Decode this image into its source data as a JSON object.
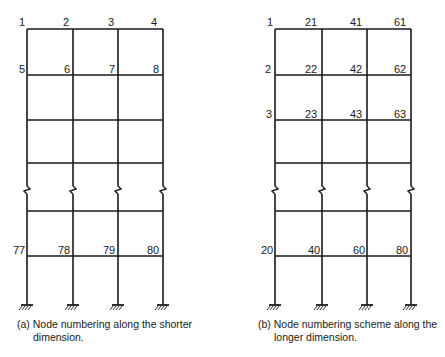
{
  "diagram": {
    "type": "plane frame node numbering",
    "frame_a": {
      "caption_line1": "(a) Node numbering along the shorter",
      "caption_line2": "dimension.",
      "columns_x": [
        27,
        73,
        118,
        163
      ],
      "levels_y": [
        29,
        75,
        120,
        163,
        211,
        256
      ],
      "base_y": 305,
      "break_y": 190,
      "labels": [
        {
          "text": "1",
          "x": 19,
          "y": 17
        },
        {
          "text": "2",
          "x": 63,
          "y": 17
        },
        {
          "text": "3",
          "x": 108,
          "y": 17
        },
        {
          "text": "4",
          "x": 151,
          "y": 17
        },
        {
          "text": "5",
          "x": 19,
          "y": 64
        },
        {
          "text": "6",
          "x": 64,
          "y": 64
        },
        {
          "text": "7",
          "x": 109,
          "y": 64
        },
        {
          "text": "8",
          "x": 153,
          "y": 64
        },
        {
          "text": "77",
          "x": 13,
          "y": 245
        },
        {
          "text": "78",
          "x": 58,
          "y": 245
        },
        {
          "text": "79",
          "x": 103,
          "y": 245
        },
        {
          "text": "80",
          "x": 147,
          "y": 245
        }
      ]
    },
    "frame_b": {
      "caption_line1": "(b) Node numbering scheme along the",
      "caption_line2": "longer dimension.",
      "columns_x": [
        275,
        322,
        367,
        411
      ],
      "levels_y": [
        29,
        75,
        120,
        163,
        211,
        256
      ],
      "base_y": 305,
      "break_y": 190,
      "labels": [
        {
          "text": "1",
          "x": 267,
          "y": 17
        },
        {
          "text": "21",
          "x": 305,
          "y": 17
        },
        {
          "text": "41",
          "x": 350,
          "y": 17
        },
        {
          "text": "61",
          "x": 394,
          "y": 17
        },
        {
          "text": "2",
          "x": 265,
          "y": 64
        },
        {
          "text": "22",
          "x": 305,
          "y": 64
        },
        {
          "text": "42",
          "x": 350,
          "y": 64
        },
        {
          "text": "62",
          "x": 394,
          "y": 64
        },
        {
          "text": "3",
          "x": 266,
          "y": 109
        },
        {
          "text": "23",
          "x": 305,
          "y": 109
        },
        {
          "text": "43",
          "x": 350,
          "y": 109
        },
        {
          "text": "63",
          "x": 394,
          "y": 109
        },
        {
          "text": "20",
          "x": 261,
          "y": 245
        },
        {
          "text": "40",
          "x": 308,
          "y": 245
        },
        {
          "text": "60",
          "x": 353,
          "y": 245
        },
        {
          "text": "80",
          "x": 396,
          "y": 245
        }
      ]
    },
    "colors": {
      "line": "#1a1a1a",
      "background": "#ffffff"
    }
  }
}
